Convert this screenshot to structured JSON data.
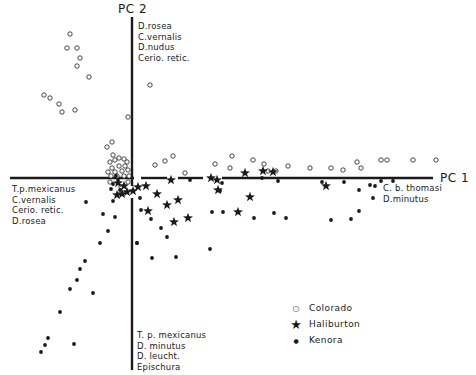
{
  "chart_data": {
    "type": "scatter",
    "title": "",
    "xlabel": "PC 1",
    "ylabel": "PC 2",
    "grid": false,
    "legend_position": "lower-right",
    "axis_loadings": {
      "pc2_positive": [
        "D.rosea",
        "C.vernalis",
        "D.nudus",
        "Cerio. retic."
      ],
      "pc2_negative": [
        "T. p. mexicanus",
        "D. minutus",
        "D. leucht.",
        "Epischura"
      ],
      "pc1_negative": [
        "T.p.mexicanus",
        "C.vernalis",
        "Cerio. retic.",
        "D.rosea"
      ],
      "pc1_positive": [
        "C. b. thomasi",
        "D.minutus"
      ]
    },
    "pixel_frame": {
      "origin_x": 132,
      "origin_y": 178,
      "pc1_extent": [
        10,
        433
      ],
      "pc2_extent": [
        17,
        370
      ]
    },
    "series": [
      {
        "name": "Colorado",
        "marker": "open-circle",
        "points_px": [
          [
            70,
            34
          ],
          [
            67,
            48
          ],
          [
            77,
            48
          ],
          [
            80,
            58
          ],
          [
            77,
            66
          ],
          [
            89,
            77
          ],
          [
            44,
            95
          ],
          [
            50,
            98
          ],
          [
            59,
            104
          ],
          [
            62,
            112
          ],
          [
            75,
            110
          ],
          [
            128,
            117
          ],
          [
            150,
            85
          ],
          [
            112,
            142
          ],
          [
            107,
            147
          ],
          [
            110,
            162
          ],
          [
            113,
            155
          ],
          [
            115,
            160
          ],
          [
            119,
            158
          ],
          [
            124,
            159
          ],
          [
            127,
            162
          ],
          [
            112,
            168
          ],
          [
            119,
            166
          ],
          [
            125,
            166
          ],
          [
            108,
            172
          ],
          [
            115,
            172
          ],
          [
            122,
            171
          ],
          [
            128,
            170
          ],
          [
            111,
            176
          ],
          [
            117,
            176
          ],
          [
            124,
            176
          ],
          [
            129,
            176
          ],
          [
            110,
            182
          ],
          [
            121,
            187
          ],
          [
            128,
            182
          ],
          [
            155,
            165
          ],
          [
            165,
            161
          ],
          [
            173,
            156
          ],
          [
            185,
            173
          ],
          [
            215,
            164
          ],
          [
            232,
            156
          ],
          [
            230,
            168
          ],
          [
            253,
            160
          ],
          [
            264,
            164
          ],
          [
            268,
            171
          ],
          [
            276,
            171
          ],
          [
            288,
            166
          ],
          [
            310,
            168
          ],
          [
            331,
            168
          ],
          [
            343,
            170
          ],
          [
            361,
            168
          ],
          [
            357,
            162
          ],
          [
            381,
            160
          ],
          [
            387,
            160
          ],
          [
            413,
            160
          ],
          [
            436,
            160
          ]
        ]
      },
      {
        "name": "Haliburton",
        "marker": "star",
        "points_px": [
          [
            118,
            183
          ],
          [
            127,
            192
          ],
          [
            124,
            186
          ],
          [
            117,
            195
          ],
          [
            122,
            194
          ],
          [
            138,
            187
          ],
          [
            146,
            186
          ],
          [
            171,
            180
          ],
          [
            211,
            178
          ],
          [
            157,
            194
          ],
          [
            167,
            205
          ],
          [
            178,
            200
          ],
          [
            174,
            222
          ],
          [
            188,
            218
          ],
          [
            148,
            211
          ],
          [
            217,
            180
          ],
          [
            218,
            190
          ],
          [
            245,
            173
          ],
          [
            238,
            212
          ],
          [
            263,
            171
          ],
          [
            273,
            172
          ],
          [
            250,
            197
          ],
          [
            326,
            186
          ],
          [
            133,
            191
          ]
        ]
      },
      {
        "name": "Kenora",
        "marker": "filled-dot",
        "points_px": [
          [
            116,
            176
          ],
          [
            118,
            180
          ],
          [
            113,
            184
          ],
          [
            111,
            189
          ],
          [
            120,
            190
          ],
          [
            86,
            202
          ],
          [
            113,
            201
          ],
          [
            103,
            214
          ],
          [
            115,
            217
          ],
          [
            108,
            231
          ],
          [
            100,
            243
          ],
          [
            137,
            243
          ],
          [
            85,
            261
          ],
          [
            80,
            269
          ],
          [
            77,
            280
          ],
          [
            70,
            289
          ],
          [
            93,
            293
          ],
          [
            60,
            312
          ],
          [
            48,
            338
          ],
          [
            45,
            345
          ],
          [
            41,
            352
          ],
          [
            74,
            344
          ],
          [
            140,
            198
          ],
          [
            141,
            210
          ],
          [
            151,
            219
          ],
          [
            161,
            228
          ],
          [
            167,
            237
          ],
          [
            152,
            258
          ],
          [
            176,
            257
          ],
          [
            137,
            243
          ],
          [
            190,
            180
          ],
          [
            222,
            183
          ],
          [
            220,
            191
          ],
          [
            212,
            212
          ],
          [
            223,
            212
          ],
          [
            210,
            249
          ],
          [
            262,
            178
          ],
          [
            278,
            181
          ],
          [
            274,
            213
          ],
          [
            286,
            218
          ],
          [
            254,
            218
          ],
          [
            322,
            182
          ],
          [
            344,
            182
          ],
          [
            359,
            190
          ],
          [
            373,
            198
          ],
          [
            375,
            186
          ],
          [
            370,
            185
          ],
          [
            359,
            211
          ],
          [
            351,
            219
          ],
          [
            331,
            220
          ],
          [
            381,
            181
          ],
          [
            393,
            181
          ]
        ]
      }
    ]
  },
  "labels": {
    "pc2_title": "PC 2",
    "pc1_title": "PC 1",
    "top_block": "D.rosea\nC.vernalis\nD.nudus\nCerio. retic.",
    "left_block": "T.p.mexicanus\nC.vernalis\nCerio. retic.\nD.rosea",
    "right_block": "C. b. thomasi\nD.minutus",
    "bottom_block": "T. p. mexicanus\nD. minutus\nD. leucht.\nEpischura"
  },
  "legend": {
    "items": [
      {
        "symbol": "○",
        "label": "Colorado"
      },
      {
        "symbol": "★",
        "label": "Haliburton"
      },
      {
        "symbol": "●",
        "label": "Kenora"
      }
    ]
  },
  "colors": {
    "ink": "#1a1a1a",
    "paper": "#ffffff"
  }
}
